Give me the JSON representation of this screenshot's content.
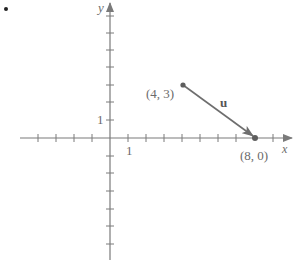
{
  "diagram": {
    "type": "vector-on-coordinate-plane",
    "bullet_marker": "•",
    "axes": {
      "x_label": "x",
      "y_label": "y",
      "x_unit_label": "1",
      "y_unit_label": "1",
      "axis_color": "#7a7a7a"
    },
    "vector": {
      "label": "u",
      "color": "#6e6e6e",
      "initial_point": {
        "label": "(4, 3)",
        "x": 4,
        "y": 3
      },
      "terminal_point": {
        "label": "(8, 0)",
        "x": 8,
        "y": 0
      }
    }
  }
}
